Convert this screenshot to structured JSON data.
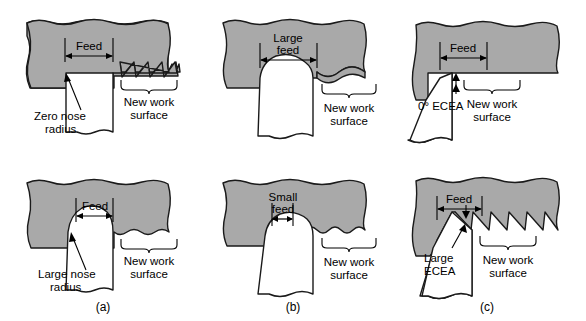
{
  "figure": {
    "type": "technical-diagram",
    "background_color": "#ffffff",
    "workpiece_color": "#a9a9a9",
    "tool_color": "#ffffff",
    "outline_color": "#1a1a1a",
    "grid": {
      "rows": 2,
      "columns": 3
    }
  },
  "panels": {
    "a": {
      "letter": "(a)",
      "variable": "nose radius",
      "top": {
        "feed_label": "Feed",
        "tool_label": "Zero nose radius",
        "tool_label_line1": "Zero nose",
        "tool_label_line2": "radius",
        "surface_label": "New work surface",
        "surface_label_line1": "New work",
        "surface_label_line2": "surface",
        "surface_profile": "sharp-sawtooth"
      },
      "bottom": {
        "feed_label": "Feed",
        "tool_label": "Large nose radius",
        "tool_label_line1": "Large nose",
        "tool_label_line2": "radius",
        "surface_label": "New work surface",
        "surface_label_line1": "New work",
        "surface_label_line2": "surface",
        "surface_profile": "shallow-scallop"
      }
    },
    "b": {
      "letter": "(b)",
      "variable": "feed rate",
      "top": {
        "feed_label": "Large feed",
        "feed_label_line1": "Large",
        "feed_label_line2": "feed",
        "surface_label": "New work surface",
        "surface_label_line1": "New work",
        "surface_label_line2": "surface",
        "surface_profile": "wide-deep-scallop"
      },
      "bottom": {
        "feed_label": "Small feed",
        "feed_label_line1": "Small",
        "feed_label_line2": "feed",
        "surface_label": "New work surface",
        "surface_label_line1": "New work",
        "surface_label_line2": "surface",
        "surface_profile": "narrow-shallow-scallop"
      }
    },
    "c": {
      "letter": "(c)",
      "variable": "end cutting edge angle",
      "top": {
        "feed_label": "Feed",
        "tool_label": "0° ECEA",
        "surface_label": "New work surface",
        "surface_label_line1": "New work",
        "surface_label_line2": "surface",
        "surface_profile": "flat"
      },
      "bottom": {
        "feed_label": "Feed",
        "tool_label": "Large ECEA",
        "tool_label_line1": "Large",
        "tool_label_line2": "ECEA",
        "surface_label": "New work surface",
        "surface_label_line1": "New work",
        "surface_label_line2": "surface",
        "surface_profile": "deep-sawtooth"
      }
    }
  }
}
